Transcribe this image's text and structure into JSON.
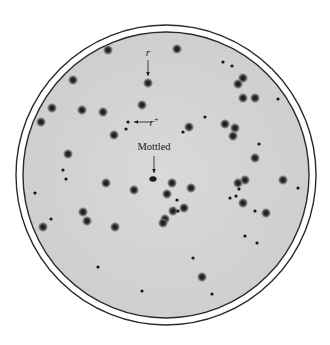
{
  "figure": {
    "dish": {
      "cx": 166,
      "cy": 175,
      "outer_r": 150,
      "inner_r": 143,
      "rim_color": "#2a2a2a",
      "agar_color": "#d6d6d6"
    },
    "labels": [
      {
        "id": "r",
        "text": "r",
        "x": 148,
        "y": 56,
        "italic": true,
        "arrow": {
          "x1": 148,
          "y1": 60,
          "x2": 148,
          "y2": 76
        }
      },
      {
        "id": "r-plus",
        "text": "r",
        "sup": "+",
        "x": 154,
        "y": 126,
        "italic": true,
        "arrow": {
          "x1": 152,
          "y1": 122,
          "x2": 134,
          "y2": 122
        }
      },
      {
        "id": "mottled",
        "text": "Mottled",
        "x": 154,
        "y": 150,
        "italic": false,
        "arrow": {
          "x1": 154,
          "y1": 156,
          "x2": 154,
          "y2": 173
        }
      }
    ],
    "large_plaques": [
      [
        108,
        50
      ],
      [
        177,
        49
      ],
      [
        73,
        80
      ],
      [
        148,
        83
      ],
      [
        142,
        105
      ],
      [
        103,
        112
      ],
      [
        52,
        108
      ],
      [
        41,
        122
      ],
      [
        82,
        110
      ],
      [
        189,
        127
      ],
      [
        225,
        124
      ],
      [
        235,
        128
      ],
      [
        233,
        136
      ],
      [
        68,
        154
      ],
      [
        106,
        183
      ],
      [
        134,
        190
      ],
      [
        172,
        183
      ],
      [
        191,
        188
      ],
      [
        167,
        194
      ],
      [
        173,
        211
      ],
      [
        184,
        208
      ],
      [
        165,
        219
      ],
      [
        163,
        223
      ],
      [
        83,
        212
      ],
      [
        87,
        221
      ],
      [
        115,
        227
      ],
      [
        43,
        227
      ],
      [
        255,
        158
      ],
      [
        245,
        180
      ],
      [
        238,
        183
      ],
      [
        243,
        203
      ],
      [
        266,
        213
      ],
      [
        283,
        180
      ],
      [
        238,
        84
      ],
      [
        243,
        78
      ],
      [
        243,
        98
      ],
      [
        255,
        98
      ],
      [
        202,
        277
      ],
      [
        114,
        135
      ]
    ],
    "mottled_plaque": [
      153,
      179
    ],
    "small_plaques": [
      [
        128,
        122
      ],
      [
        126,
        129
      ],
      [
        205,
        117
      ],
      [
        183,
        132
      ],
      [
        223,
        62
      ],
      [
        232,
        66
      ],
      [
        278,
        99
      ],
      [
        259,
        144
      ],
      [
        63,
        170
      ],
      [
        66,
        179
      ],
      [
        35,
        193
      ],
      [
        51,
        219
      ],
      [
        177,
        200
      ],
      [
        178,
        211
      ],
      [
        230,
        198
      ],
      [
        236,
        196
      ],
      [
        239,
        189
      ],
      [
        255,
        211
      ],
      [
        298,
        188
      ],
      [
        245,
        236
      ],
      [
        257,
        243
      ],
      [
        193,
        258
      ],
      [
        98,
        267
      ],
      [
        142,
        291
      ],
      [
        212,
        294
      ]
    ]
  }
}
